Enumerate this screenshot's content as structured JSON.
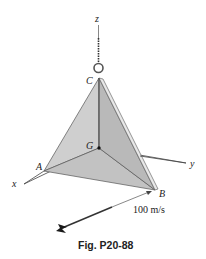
{
  "figure": {
    "caption": "Fig. P20-88",
    "labels": {
      "z": "z",
      "y": "y",
      "x": "x",
      "A": "A",
      "B": "B",
      "C": "C",
      "G": "G"
    },
    "velocity_label": "100 m/s",
    "colors": {
      "plate_left": "#c9c9c9",
      "plate_right": "#b5b5b5",
      "plate_edge": "#e6e6e6",
      "lines": "#333333"
    }
  }
}
